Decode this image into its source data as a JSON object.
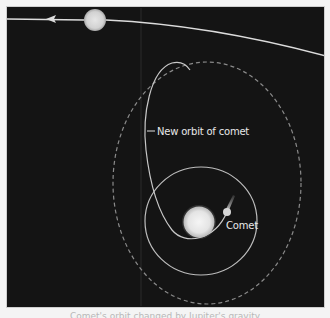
{
  "diagram": {
    "type": "orbital-diagram",
    "background": "#141414",
    "colors": {
      "orbit_line": "#d9d9d9",
      "dashed_orbit": "#8a8a8a",
      "sun": "#f2f2f2",
      "planet": "#dcdcdc",
      "label": "#e8e8e8"
    },
    "labels": {
      "new_orbit": "New orbit of comet",
      "comet": "Comet"
    },
    "elements": {
      "planet_orbit": {
        "description": "large orbit of planet with direction arrow pointing left"
      },
      "planet": {
        "cx": 95,
        "cy": 20,
        "r": 11
      },
      "sun": {
        "cx": 199,
        "cy": 222,
        "r": 16
      },
      "comet": {
        "cx": 227,
        "cy": 212,
        "r": 4
      },
      "inner_orbit": {
        "cx": 201,
        "cy": 221,
        "rx": 56,
        "ry": 54,
        "style": "solid"
      },
      "old_orbit": {
        "cx": 207,
        "cy": 183,
        "rx": 94,
        "ry": 121,
        "style": "dashed"
      },
      "new_orbit": {
        "style": "solid",
        "shape": "elongated loop"
      }
    }
  },
  "caption": {
    "text": "Comet's orbit changed by Jupiter's gravity"
  }
}
